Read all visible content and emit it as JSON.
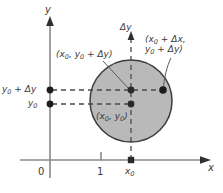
{
  "figure": {
    "kind": "math-diagram",
    "background_color": "#ffffff",
    "axis_color": "#8a8a8a",
    "ink_color": "#3a3a3a",
    "disk_fill_color": "#b9b9b9",
    "disk_stroke_color": "#3d3d3d",
    "dash_color": "#4a4a4a"
  },
  "axes": {
    "y_axis_label": "y",
    "x_axis_label": "x",
    "delta_y_axis_label": "Δy",
    "x_ticks": [
      {
        "label": "0",
        "at": "origin"
      },
      {
        "label": "1",
        "at": "unit"
      }
    ],
    "x_marker_label": "x",
    "x_marker_sub": "0",
    "y_ticks": [
      {
        "label": "y",
        "sub": "0",
        "suffix": " + Δy"
      },
      {
        "label": "y",
        "sub": "0",
        "suffix": ""
      }
    ]
  },
  "points": [
    {
      "name": "center-point",
      "label_line1": "(x",
      "label_sub1": "0",
      "label_mid": ", y",
      "label_sub2": "0",
      "label_end": ")"
    },
    {
      "name": "top-center-point",
      "label_line1": "(x",
      "label_sub1": "0",
      "label_mid": ", y",
      "label_sub2": "0",
      "label_end": " + Δy)"
    },
    {
      "name": "right-point",
      "label_line1": "(x",
      "label_sub1": "0",
      "label_mid": " + Δx,",
      "label_line2": "y",
      "label_sub2": "0",
      "label_end2": " + Δy)"
    }
  ],
  "labels": {
    "y_axis": "y",
    "x_axis": "x",
    "delta_y": "Δy",
    "tick_zero": "0",
    "tick_one": "1",
    "x_sub_zero_base": "x",
    "x_sub_zero_sub": "0",
    "y0_plus_dy_base": "y",
    "y0_plus_dy_sub": "0",
    "y0_plus_dy_rest": " + Δy",
    "y0_base": "y",
    "y0_sub": "0",
    "center_base": "(x",
    "center_sub1": "0",
    "center_mid": ", y",
    "center_sub2": "0",
    "center_end": ")",
    "topleft_base": "(x",
    "topleft_sub1": "0",
    "topleft_mid": ", y",
    "topleft_sub2": "0",
    "topleft_end": " + Δy)",
    "topright_l1_base": "(x",
    "topright_l1_sub": "0",
    "topright_l1_rest": " + Δx,",
    "topright_l2_base": "y",
    "topright_l2_sub": "0",
    "topright_l2_rest": " + Δy)"
  },
  "geometry": {
    "y_axis_x": 50,
    "x_axis_y": 160,
    "circle_cx": 131,
    "circle_cy": 101,
    "circle_r": 41,
    "dot_top_y": 90,
    "dot_center_y": 104,
    "dot_right_x": 163,
    "tick_one_x": 101
  }
}
